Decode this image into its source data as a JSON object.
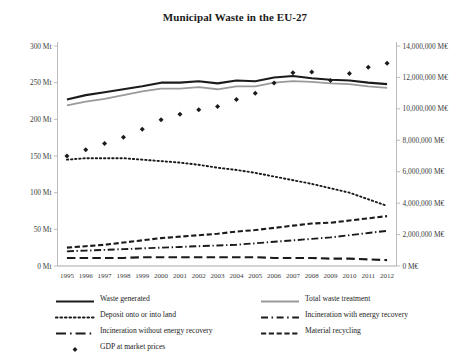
{
  "chart_data": {
    "type": "line",
    "title": "Municipal Waste in the EU-27",
    "xlabel": "",
    "ylabel": "",
    "grid": false,
    "legend_position": "bottom",
    "categories": [
      "1995",
      "1996",
      "1997",
      "1998",
      "1999",
      "2000",
      "2001",
      "2002",
      "2003",
      "2004",
      "2005",
      "2006",
      "2007",
      "2008",
      "2009",
      "2010",
      "2011",
      "2012"
    ],
    "y_left": {
      "label_suffix": "Mt",
      "ticks": [
        "0 Mt",
        "50 Mt",
        "100 Mt",
        "150 Mt",
        "200 Mt",
        "250 Mt",
        "300 Mt"
      ],
      "tick_values": [
        0,
        50,
        100,
        150,
        200,
        250,
        300
      ],
      "ylim": [
        0,
        300
      ]
    },
    "y_right": {
      "label_suffix": "M€",
      "ticks": [
        "0 M€",
        "2,000,000 M€",
        "4,000,000 M€",
        "6,000,000 M€",
        "8,000,000 M€",
        "10,000,000 M€",
        "12,000,000 M€",
        "14,000,000 M€"
      ],
      "tick_values": [
        0,
        2000000,
        4000000,
        6000000,
        8000000,
        10000000,
        12000000,
        14000000
      ],
      "ylim": [
        0,
        14000000
      ]
    },
    "series": [
      {
        "name": "Waste generated",
        "axis": "left",
        "style": "solid",
        "color": "#1b1b1b",
        "width": 2.1,
        "values": [
          227,
          233,
          237,
          241,
          245,
          250,
          250,
          252,
          249,
          253,
          252,
          257,
          259,
          256,
          254,
          253,
          250,
          248
        ]
      },
      {
        "name": "Total waste treatment",
        "axis": "left",
        "style": "solid",
        "color": "#9a9a9a",
        "width": 1.8,
        "values": [
          219,
          224,
          228,
          233,
          238,
          242,
          242,
          244,
          241,
          245,
          245,
          250,
          252,
          251,
          249,
          248,
          245,
          243
        ]
      },
      {
        "name": "Deposit onto or into land",
        "axis": "left",
        "style": "dotted",
        "color": "#1b1b1b",
        "width": 1.9,
        "values": [
          145,
          147,
          147,
          147,
          145,
          143,
          141,
          138,
          134,
          131,
          127,
          122,
          117,
          112,
          106,
          100,
          91,
          82
        ]
      },
      {
        "name": "Incineration with energy recovery",
        "axis": "left",
        "style": "dashdot",
        "color": "#1b1b1b",
        "width": 1.9,
        "values": [
          20,
          21,
          22,
          23,
          24,
          25,
          26,
          27,
          28,
          29,
          31,
          33,
          35,
          37,
          39,
          42,
          45,
          48
        ]
      },
      {
        "name": "Incineration without energy recovery",
        "axis": "left",
        "style": "longdash",
        "color": "#1b1b1b",
        "width": 2.1,
        "values": [
          11,
          11,
          11,
          11,
          12,
          12,
          12,
          12,
          12,
          12,
          12,
          11,
          11,
          11,
          10,
          10,
          9,
          8
        ]
      },
      {
        "name": "Material recycling",
        "axis": "left",
        "style": "dashed",
        "color": "#1b1b1b",
        "width": 2.1,
        "values": [
          25,
          27,
          29,
          32,
          35,
          38,
          40,
          42,
          44,
          47,
          49,
          52,
          55,
          58,
          59,
          62,
          65,
          68
        ]
      },
      {
        "name": "GDP at market prices",
        "axis": "right",
        "style": "marker",
        "marker": "diamond",
        "color": "#1b1b1b",
        "width": 0,
        "values": [
          7000000,
          7400000,
          7800000,
          8200000,
          8700000,
          9300000,
          9650000,
          9950000,
          10150000,
          10600000,
          11000000,
          11650000,
          12300000,
          12350000,
          11800000,
          12250000,
          12650000,
          12900000
        ]
      }
    ],
    "legend": [
      {
        "label": "Waste generated",
        "style": "solid",
        "color": "#1b1b1b",
        "column": "left",
        "row": 0
      },
      {
        "label": "Total waste treatment",
        "style": "solid",
        "color": "#9a9a9a",
        "column": "right",
        "row": 0
      },
      {
        "label": "Deposit onto or into land",
        "style": "dotted",
        "color": "#1b1b1b",
        "column": "left",
        "row": 1
      },
      {
        "label": "Incineration with energy recovery",
        "style": "dashdot",
        "color": "#1b1b1b",
        "column": "right",
        "row": 1
      },
      {
        "label": "Incineration without energy recovery",
        "style": "longdash",
        "color": "#1b1b1b",
        "column": "left",
        "row": 2
      },
      {
        "label": "Material recycling",
        "style": "dashed",
        "color": "#1b1b1b",
        "column": "right",
        "row": 2
      },
      {
        "label": "GDP at market prices",
        "style": "marker",
        "color": "#1b1b1b",
        "column": "left",
        "row": 3
      }
    ]
  }
}
